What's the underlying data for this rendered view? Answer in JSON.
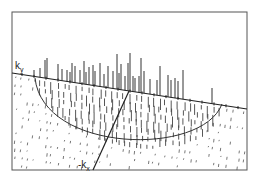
{
  "diagram": {
    "title": "",
    "labels": {
      "ky_main": "k",
      "ky_sub": "y",
      "kx_main": "-k",
      "kx_sub": "x"
    },
    "colors": {
      "line": "#333333",
      "frame": "#555555",
      "background": "#ffffff"
    },
    "frame": {
      "x": 12,
      "y": 12,
      "width": 235,
      "height": 158
    },
    "ky_axis": {
      "x1": 12,
      "y1": 73,
      "x2": 247,
      "y2": 109
    },
    "kx_axis": {
      "x1": 129,
      "y1": 91,
      "x2": 93,
      "y2": 170
    },
    "semicircle": {
      "x1": 35,
      "y1": 78,
      "x2": 222,
      "y2": 104,
      "bottom_y": 145
    },
    "spikes": [
      [
        34,
        76,
        70
      ],
      [
        40,
        78,
        68
      ],
      [
        45,
        78,
        60
      ],
      [
        47,
        79,
        58
      ],
      [
        58,
        81,
        64
      ],
      [
        62,
        81,
        69
      ],
      [
        67,
        82,
        70
      ],
      [
        70,
        82,
        72
      ],
      [
        72,
        83,
        63
      ],
      [
        75,
        83,
        66
      ],
      [
        80,
        84,
        70
      ],
      [
        84,
        84,
        61
      ],
      [
        86,
        85,
        72
      ],
      [
        89,
        85,
        67
      ],
      [
        93,
        86,
        65
      ],
      [
        95,
        86,
        71
      ],
      [
        96,
        14,
        86
      ],
      [
        100,
        87,
        63
      ],
      [
        104,
        87,
        74
      ],
      [
        108,
        88,
        66
      ],
      [
        113,
        89,
        71
      ],
      [
        117,
        89,
        54
      ],
      [
        119,
        90,
        73
      ],
      [
        121,
        90,
        64
      ],
      [
        125,
        91,
        76
      ],
      [
        128,
        91,
        63
      ],
      [
        130,
        92,
        53
      ],
      [
        133,
        92,
        76
      ],
      [
        135,
        93,
        78
      ],
      [
        139,
        93,
        76
      ],
      [
        141,
        94,
        58
      ],
      [
        144,
        94,
        71
      ],
      [
        150,
        95,
        79
      ],
      [
        157,
        96,
        80
      ],
      [
        160,
        97,
        66
      ],
      [
        168,
        98,
        75
      ],
      [
        171,
        99,
        80
      ],
      [
        175,
        99,
        78
      ],
      [
        178,
        100,
        81
      ],
      [
        183,
        101,
        70
      ],
      [
        212,
        105,
        88
      ]
    ],
    "hatch": {
      "inside_spacing_x": 7,
      "inside_spacing_y": 9,
      "outside_spacing_x": 10,
      "outside_spacing_y": 12
    }
  }
}
